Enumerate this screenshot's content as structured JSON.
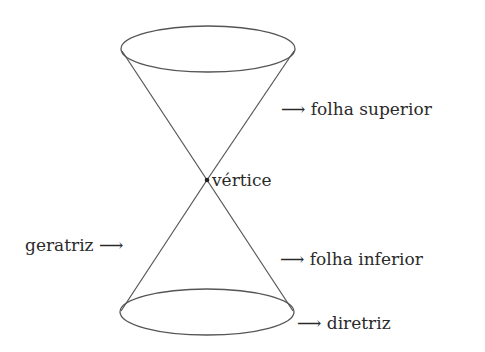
{
  "figure": {
    "type": "double-cone",
    "stroke_color": "#555555",
    "text_color": "#2a2a2a",
    "vertex": {
      "x": 207,
      "y": 180
    },
    "top_ellipse": {
      "cx": 208,
      "cy": 49,
      "rx": 87,
      "ry": 23
    },
    "bottom_ellipse": {
      "cx": 207,
      "cy": 312,
      "rx": 87,
      "ry": 23
    }
  },
  "labels": {
    "upper_nappe": "⟶ folha superior",
    "vertex": "vértice",
    "generatrix": "geratriz ⟶",
    "lower_nappe": "⟶ folha inferior",
    "directrix": "⟶ diretriz"
  }
}
